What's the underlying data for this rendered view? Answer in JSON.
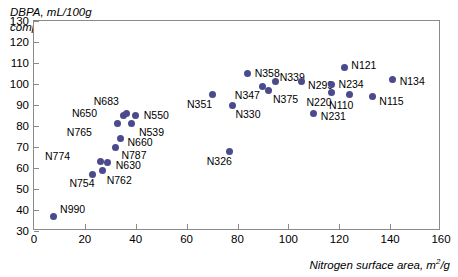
{
  "chart_data": {
    "type": "scatter",
    "title": "",
    "ylabel": "DBPA, mL/100g\ncompressed sample",
    "xlabel": "Nitrogen surface area, m²/g",
    "xlim": [
      0,
      160
    ],
    "ylim": [
      30,
      130
    ],
    "xticks": [
      0,
      20,
      40,
      60,
      80,
      100,
      120,
      140,
      160
    ],
    "yticks": [
      30,
      40,
      50,
      60,
      70,
      80,
      90,
      100,
      110,
      120,
      130
    ],
    "grid": false,
    "legend": "none",
    "marker_color": "#4a4a8c",
    "points": [
      {
        "label": "N990",
        "x": 7.5,
        "y": 37,
        "lx": 7,
        "ly": -7
      },
      {
        "label": "N754",
        "x": 23,
        "y": 57,
        "lx": -4,
        "ly": 9
      },
      {
        "label": "N774",
        "x": 26,
        "y": 63,
        "lx": -36,
        "ly": -6
      },
      {
        "label": "N630",
        "x": 29,
        "y": 62.5,
        "lx": 8,
        "ly": 2
      },
      {
        "label": "N762",
        "x": 27,
        "y": 59,
        "lx": 4,
        "ly": 10
      },
      {
        "label": "N787",
        "x": 32,
        "y": 70,
        "lx": 6,
        "ly": 8
      },
      {
        "label": "N660",
        "x": 34,
        "y": 74,
        "lx": 7,
        "ly": 3
      },
      {
        "label": "N765",
        "x": 33,
        "y": 81,
        "lx": -32,
        "ly": 8
      },
      {
        "label": "N650",
        "x": 35,
        "y": 85,
        "lx": -32,
        "ly": -3
      },
      {
        "label": "N683",
        "x": 36.5,
        "y": 86,
        "lx": -14,
        "ly": -12
      },
      {
        "label": "N539",
        "x": 38.5,
        "y": 81,
        "lx": 7,
        "ly": 8
      },
      {
        "label": "N550",
        "x": 40,
        "y": 85,
        "lx": 8,
        "ly": -1
      },
      {
        "label": "N326",
        "x": 77,
        "y": 68,
        "lx": -4,
        "ly": 10
      },
      {
        "label": "N351",
        "x": 70,
        "y": 95,
        "lx": -6,
        "ly": 9
      },
      {
        "label": "N330",
        "x": 78,
        "y": 90,
        "lx": 3,
        "ly": 9
      },
      {
        "label": "N358",
        "x": 84,
        "y": 105,
        "lx": 7,
        "ly": -1
      },
      {
        "label": "N347",
        "x": 90,
        "y": 99,
        "lx": -9,
        "ly": 9
      },
      {
        "label": "N375",
        "x": 92,
        "y": 97,
        "lx": 5,
        "ly": 9
      },
      {
        "label": "N339",
        "x": 95,
        "y": 101,
        "lx": 4,
        "ly": -5
      },
      {
        "label": "N299",
        "x": 105,
        "y": 101,
        "lx": 7,
        "ly": 3
      },
      {
        "label": "N231",
        "x": 110,
        "y": 86,
        "lx": 7,
        "ly": 3
      },
      {
        "label": "N234",
        "x": 117,
        "y": 100,
        "lx": 7,
        "ly": 0
      },
      {
        "label": "N220",
        "x": 117,
        "y": 96,
        "lx": -6,
        "ly": 10
      },
      {
        "label": "N121",
        "x": 122,
        "y": 108,
        "lx": 7,
        "ly": -2
      },
      {
        "label": "N110",
        "x": 124,
        "y": 95,
        "lx": -2,
        "ly": 10
      },
      {
        "label": "N115",
        "x": 133,
        "y": 94,
        "lx": 7,
        "ly": 4
      },
      {
        "label": "N134",
        "x": 141,
        "y": 102,
        "lx": 7,
        "ly": 1
      }
    ]
  }
}
